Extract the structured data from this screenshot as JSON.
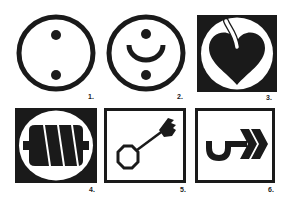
{
  "figure": {
    "symbols": [
      {
        "index": 1,
        "label": "1.",
        "icon": "circle-two-dots-icon"
      },
      {
        "index": 2,
        "label": "2.",
        "icon": "circle-smile-dots-icon"
      },
      {
        "index": 3,
        "label": "3.",
        "icon": "heart-with-stem-icon"
      },
      {
        "index": 4,
        "label": "4.",
        "icon": "twisted-roll-icon"
      },
      {
        "index": 5,
        "label": "5.",
        "icon": "key-icon"
      },
      {
        "index": 6,
        "label": "6.",
        "icon": "hook-arrow-icon"
      }
    ],
    "colors": {
      "ink": "#1a1a1a",
      "paper": "#ffffff"
    }
  }
}
